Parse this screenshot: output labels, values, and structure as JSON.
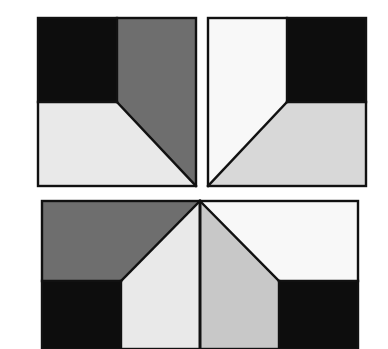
{
  "figure": {
    "canvas": {
      "width": 388,
      "height": 349
    },
    "background_color": "#ffffff",
    "stroke_color": "#111111",
    "stroke_width": 2.4
  },
  "palette": {
    "black": "#0d0d0d",
    "dark_gray": "#6e6e6e",
    "mid_gray": "#c8c8c8",
    "light_gray": "#d8d8d8",
    "pale_gray": "#e9e9e9",
    "white": "#f8f8f8",
    "outline": "#111111",
    "background": "#ffffff"
  },
  "tiles": [
    {
      "id": "tile-top-left",
      "label": "Top left tile",
      "bounds": {
        "x": 38,
        "y": 18,
        "width": 158,
        "height": 168
      },
      "center": {
        "x": 117,
        "y": 102
      },
      "regions": [
        {
          "name": "black-quadrant",
          "color_key": "black",
          "color": "#0d0d0d",
          "points": "38,18 117,18 117,102 38,102"
        },
        {
          "name": "gray-wedge",
          "color_key": "dark_gray",
          "color": "#6e6e6e",
          "points": "117,18 196,18 196,186 117,102"
        },
        {
          "name": "light-wedge",
          "color_key": "pale_gray",
          "color": "#e9e9e9",
          "points": "38,102 117,102 196,186 38,186"
        }
      ]
    },
    {
      "id": "tile-top-right",
      "label": "Top right tile",
      "bounds": {
        "x": 208,
        "y": 18,
        "width": 158,
        "height": 168
      },
      "center": {
        "x": 287,
        "y": 102
      },
      "regions": [
        {
          "name": "white-wedge",
          "color_key": "white",
          "color": "#f8f8f8",
          "points": "208,18 287,18 287,102 208,186"
        },
        {
          "name": "black-quadrant",
          "color_key": "black",
          "color": "#0d0d0d",
          "points": "287,18 366,18 366,102 287,102"
        },
        {
          "name": "light-wedge",
          "color_key": "light_gray",
          "color": "#d8d8d8",
          "points": "287,102 366,102 366,186 208,186"
        }
      ]
    },
    {
      "id": "tile-bottom-left",
      "label": "Bottom left tile",
      "bounds": {
        "x": 42,
        "y": 201,
        "width": 158,
        "height": 148
      },
      "center": {
        "x": 121,
        "y": 281
      },
      "regions": [
        {
          "name": "gray-wedge",
          "color_key": "dark_gray",
          "color": "#6e6e6e",
          "points": "42,201 200,201 121,281 42,281"
        },
        {
          "name": "black-quadrant",
          "color_key": "black",
          "color": "#0d0d0d",
          "points": "42,281 121,281 121,349 42,349"
        },
        {
          "name": "light-wedge",
          "color_key": "pale_gray",
          "color": "#e9e9e9",
          "points": "200,201 200,349 121,349 121,281"
        }
      ]
    },
    {
      "id": "tile-bottom-right",
      "label": "Bottom right tile",
      "bounds": {
        "x": 200,
        "y": 201,
        "width": 158,
        "height": 148
      },
      "center": {
        "x": 279,
        "y": 281
      },
      "regions": [
        {
          "name": "gray-wedge",
          "color_key": "mid_gray",
          "color": "#c8c8c8",
          "points": "200,201 279,281 279,349 200,349"
        },
        {
          "name": "white-wedge",
          "color_key": "white",
          "color": "#f8f8f8",
          "points": "200,201 358,201 358,281 279,281"
        },
        {
          "name": "black-quadrant",
          "color_key": "black",
          "color": "#0d0d0d",
          "points": "279,281 358,281 358,349 279,349"
        }
      ]
    }
  ],
  "dividers": [
    {
      "name": "top-left-diagonal",
      "from": {
        "x": 117,
        "y": 102
      },
      "to": {
        "x": 196,
        "y": 186
      }
    },
    {
      "name": "top-left-vertical",
      "from": {
        "x": 117,
        "y": 18
      },
      "to": {
        "x": 117,
        "y": 102
      }
    },
    {
      "name": "top-left-horizontal",
      "from": {
        "x": 38,
        "y": 102
      },
      "to": {
        "x": 117,
        "y": 102
      }
    },
    {
      "name": "top-right-diagonal",
      "from": {
        "x": 287,
        "y": 102
      },
      "to": {
        "x": 208,
        "y": 186
      }
    },
    {
      "name": "top-right-vertical",
      "from": {
        "x": 287,
        "y": 18
      },
      "to": {
        "x": 287,
        "y": 102
      }
    },
    {
      "name": "top-right-horizontal",
      "from": {
        "x": 287,
        "y": 102
      },
      "to": {
        "x": 366,
        "y": 102
      }
    },
    {
      "name": "bottom-left-diagonal",
      "from": {
        "x": 200,
        "y": 201
      },
      "to": {
        "x": 121,
        "y": 281
      }
    },
    {
      "name": "bottom-left-horizontal",
      "from": {
        "x": 42,
        "y": 281
      },
      "to": {
        "x": 121,
        "y": 281
      }
    },
    {
      "name": "bottom-left-vertical",
      "from": {
        "x": 121,
        "y": 281
      },
      "to": {
        "x": 121,
        "y": 349
      }
    },
    {
      "name": "bottom-center-vertical",
      "from": {
        "x": 200,
        "y": 201
      },
      "to": {
        "x": 200,
        "y": 349
      }
    },
    {
      "name": "bottom-right-diagonal",
      "from": {
        "x": 200,
        "y": 201
      },
      "to": {
        "x": 279,
        "y": 281
      }
    },
    {
      "name": "bottom-right-horizontal",
      "from": {
        "x": 279,
        "y": 281
      },
      "to": {
        "x": 358,
        "y": 281
      }
    },
    {
      "name": "bottom-right-vertical",
      "from": {
        "x": 279,
        "y": 281
      },
      "to": {
        "x": 279,
        "y": 349
      }
    }
  ]
}
